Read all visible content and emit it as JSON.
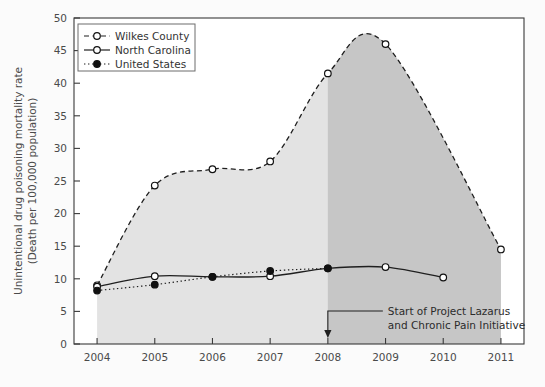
{
  "chart_data": {
    "type": "line",
    "title": "",
    "xlabel": "",
    "ylabel": "Unintentional drug poisoning mortality rate (Death per 100,000 population)",
    "ylabel_line1": "Unintentional drug poisoning mortality rate",
    "ylabel_line2": "(Death per 100,000 population)",
    "x": [
      2004,
      2005,
      2006,
      2007,
      2008,
      2009,
      2010,
      2011
    ],
    "xlim": [
      2003.6,
      2011.4
    ],
    "ylim": [
      0,
      50
    ],
    "xticks": [
      "2004",
      "2005",
      "2006",
      "2007",
      "2008",
      "2009",
      "2010",
      "2011"
    ],
    "yticks": [
      "0",
      "5",
      "10",
      "15",
      "20",
      "25",
      "30",
      "35",
      "40",
      "45",
      "50"
    ],
    "grid": false,
    "legend_position": "top-left",
    "series": [
      {
        "name": "Wilkes County",
        "style": "dashed",
        "marker": "open-circle",
        "x": [
          2004,
          2005,
          2006,
          2007,
          2008,
          2009,
          2011
        ],
        "values": [
          9.0,
          24.3,
          26.8,
          28.0,
          41.5,
          46.0,
          14.5
        ]
      },
      {
        "name": "North Carolina",
        "style": "solid",
        "marker": "open-circle",
        "x": [
          2004,
          2005,
          2006,
          2007,
          2008,
          2009,
          2010
        ],
        "values": [
          8.8,
          10.4,
          10.3,
          10.4,
          11.6,
          11.8,
          10.2
        ]
      },
      {
        "name": "United States",
        "style": "dotted",
        "marker": "filled-circle",
        "x": [
          2004,
          2005,
          2006,
          2007,
          2008
        ],
        "values": [
          8.2,
          9.1,
          10.3,
          11.2,
          11.6
        ]
      }
    ],
    "annotations": [
      {
        "line1": "Start of Project Lazarus",
        "line2": "and Chronic Pain Initiative",
        "points_to_x": 2008,
        "arrow": "down"
      }
    ],
    "shaded_regions": [
      {
        "name": "pre-intervention-fill",
        "from": 2004,
        "to": 2008,
        "color": "#e3e3e3"
      },
      {
        "name": "post-intervention-fill",
        "from": 2008,
        "to": 2011,
        "color": "#c6c6c6"
      }
    ],
    "colors": {
      "axis": "#3a3a3a",
      "line": "#1f1f1f",
      "light_fill": "#e3e3e3",
      "dark_fill": "#c6c6c6",
      "background": "#fbfbfb"
    }
  }
}
